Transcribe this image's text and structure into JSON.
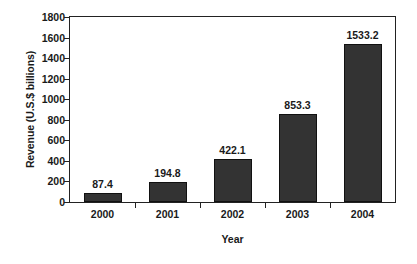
{
  "chart_data": {
    "type": "bar",
    "title": "",
    "subtitle": "",
    "xlabel": "Year",
    "ylabel": "Revenue (U.S.$ billions)",
    "categories": [
      "2000",
      "2001",
      "2002",
      "2003",
      "2004"
    ],
    "values": [
      87.4,
      194.8,
      422.1,
      853.3,
      1533.2
    ],
    "value_labels": [
      "87.4",
      "194.8",
      "422.1",
      "853.3",
      "1533.2"
    ],
    "ylim": [
      0,
      1800
    ],
    "ytick_labels": [
      "1800",
      "1600",
      "1400",
      "1200",
      "1000",
      "800",
      "600",
      "400",
      "200",
      "0"
    ],
    "ytick_values": [
      1800,
      1600,
      1400,
      1200,
      1000,
      800,
      600,
      400,
      200,
      0
    ],
    "ytick_step": 200,
    "grid": false,
    "legend": false,
    "legend_position": "none",
    "bar_color": "#333333",
    "bar_edge_color": "#111111",
    "axis_color": "#222222",
    "background_color": "#ffffff",
    "data_labels_shown": true
  }
}
